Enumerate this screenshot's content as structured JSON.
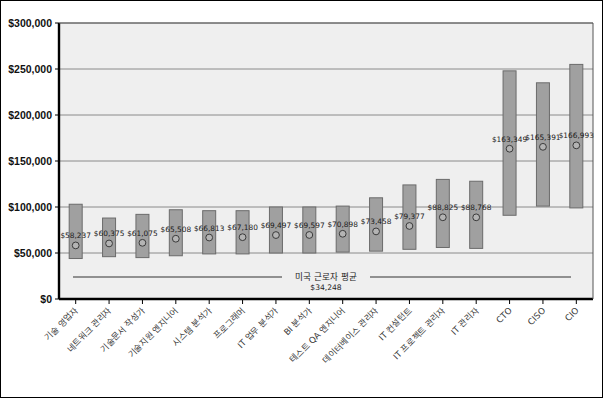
{
  "chart_data": {
    "type": "bar",
    "title": "",
    "subtitle": "",
    "xlabel": "",
    "ylabel": "",
    "ylim": [
      0,
      300000
    ],
    "grid": true,
    "legend": null,
    "ytick_labels": [
      "$0",
      "$50,000",
      "$100,000",
      "$150,000",
      "$200,000",
      "$250,000",
      "$300,000"
    ],
    "ytick_values": [
      0,
      50000,
      100000,
      150000,
      200000,
      250000,
      300000
    ],
    "categories": [
      "기술 영업자",
      "네트워크 관리자",
      "기술문서 작성가",
      "기술지원 엔지니어",
      "시스템 분석가",
      "프로그래머",
      "IT 업무 분석가",
      "BI 분석가",
      "테스트 QA 엔지니어",
      "데이터베이스 관리자",
      "IT 컨설턴트",
      "IT 프로젝트 관리자",
      "IT 관리자",
      "CTO",
      "CISO",
      "CIO"
    ],
    "median_labels": [
      "$58,237",
      "$60,375",
      "$61,075",
      "$65,508",
      "$66,813",
      "$67,180",
      "$69,497",
      "$69,597",
      "$70,898",
      "$73,458",
      "$79,377",
      "$88,825",
      "$88,768",
      "$163,349",
      "$165,391",
      "$166,993"
    ],
    "medians": [
      58237,
      60375,
      61075,
      65508,
      66813,
      67180,
      69497,
      69597,
      70898,
      73458,
      79377,
      88825,
      88768,
      163349,
      165391,
      166993
    ],
    "ranges": [
      {
        "low": 44000,
        "high": 103000
      },
      {
        "low": 46000,
        "high": 88000
      },
      {
        "low": 45000,
        "high": 92000
      },
      {
        "low": 47000,
        "high": 97000
      },
      {
        "low": 49000,
        "high": 96000
      },
      {
        "low": 49000,
        "high": 96000
      },
      {
        "low": 50000,
        "high": 100000
      },
      {
        "low": 50000,
        "high": 100000
      },
      {
        "low": 51000,
        "high": 101000
      },
      {
        "low": 52000,
        "high": 110000
      },
      {
        "low": 54000,
        "high": 124000
      },
      {
        "low": 56000,
        "high": 130000
      },
      {
        "low": 55000,
        "high": 128000
      },
      {
        "low": 91000,
        "high": 248000
      },
      {
        "low": 101000,
        "high": 235000
      },
      {
        "low": 99000,
        "high": 255000
      }
    ],
    "annotation": {
      "label": "미국 근로자 평균",
      "value": "$34,248",
      "value_number": 34248
    },
    "colors": {
      "bar_fill": "#a0a0a0",
      "bar_edge": "#6b6b6b",
      "plot_background": "#efefef",
      "grid": "#808080",
      "axis": "#000000",
      "marker_edge": "#3a3a3a",
      "marker_fill": "#b4b4b4"
    }
  }
}
